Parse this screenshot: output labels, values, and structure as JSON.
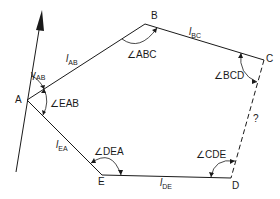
{
  "diagram": {
    "type": "traverse-polygon",
    "vertices": [
      {
        "id": "A",
        "label": "A"
      },
      {
        "id": "B",
        "label": "B"
      },
      {
        "id": "C",
        "label": "C"
      },
      {
        "id": "D",
        "label": "D"
      },
      {
        "id": "E",
        "label": "E"
      }
    ],
    "sides": [
      {
        "id": "AB",
        "l": "l",
        "sub": "AB",
        "style": "solid"
      },
      {
        "id": "BC",
        "l": "l",
        "sub": "BC",
        "style": "solid"
      },
      {
        "id": "CD",
        "label": "?",
        "style": "dashed"
      },
      {
        "id": "DE",
        "l": "l",
        "sub": "DE",
        "style": "solid"
      },
      {
        "id": "EA",
        "l": "l",
        "sub": "EA",
        "style": "solid"
      }
    ],
    "angles": [
      {
        "id": "ABC",
        "label": "∠ABC"
      },
      {
        "id": "BCD",
        "label": "∠BCD"
      },
      {
        "id": "CDE",
        "label": "∠CDE"
      },
      {
        "id": "DEA",
        "label": "∠DEA"
      },
      {
        "id": "EAB",
        "label": "∠EAB"
      }
    ],
    "bearing": {
      "symbol": "γ",
      "sub": "AB"
    },
    "north_arrow": {
      "direction": "north"
    },
    "colors": {
      "line": "#1a1a1a",
      "background": "#ffffff"
    }
  }
}
